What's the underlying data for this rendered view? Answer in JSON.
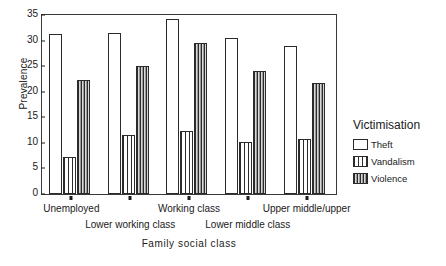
{
  "chart_data": {
    "type": "bar",
    "title": "",
    "xlabel": "Family social class",
    "ylabel": "Prevalence",
    "ylim": [
      0,
      35
    ],
    "yticks": [
      0,
      5,
      10,
      15,
      20,
      25,
      30,
      35
    ],
    "grid": false,
    "legend_position": "right",
    "legend_title": "Victimisation",
    "categories": [
      "Unemployed",
      "Lower working class",
      "Working class",
      "Lower middle class",
      "Upper middle/upper"
    ],
    "series": [
      {
        "name": "Theft",
        "values": [
          31.3,
          31.4,
          34.2,
          30.5,
          29.0
        ]
      },
      {
        "name": "Vandalism",
        "values": [
          7.2,
          11.6,
          12.3,
          10.1,
          10.8
        ]
      },
      {
        "name": "Violence",
        "values": [
          22.3,
          25.1,
          29.6,
          24.1,
          21.7
        ]
      }
    ]
  },
  "axes": {
    "y_title": "Prevalence",
    "x_title": "Family social class",
    "y_tick_labels": [
      "0",
      "5",
      "10",
      "15",
      "20",
      "25",
      "30",
      "35"
    ]
  },
  "legend": {
    "title": "Victimisation",
    "items": [
      {
        "label": "Theft",
        "pattern": "empty"
      },
      {
        "label": "Vandalism",
        "pattern": "wide-vertical-stripes"
      },
      {
        "label": "Violence",
        "pattern": "dense-vertical-stripes"
      }
    ]
  },
  "colors": {
    "axis": "#1a1a1a",
    "frame": "#3a3a3a",
    "bar_outline": "#2b2b2b",
    "theft_fill": "#ffffff",
    "vandalism_fill": "#ffffff",
    "violence_fill": "#cfcfcf",
    "background": "#ffffff"
  }
}
